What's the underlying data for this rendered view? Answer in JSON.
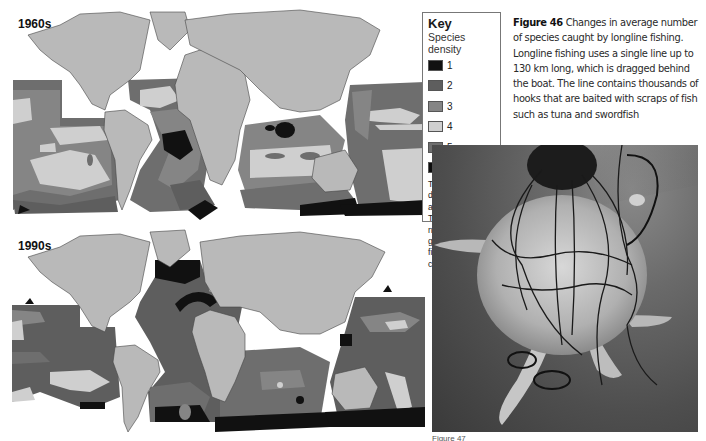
{
  "figure_46": {
    "number_label": "Figure 46",
    "caption": "Changes in average number of species caught by longline fishing. Longline fishing uses a single line up to 130 km long, which is dragged behind the boat. The line contains thousands of hooks that are baited with scraps of fish such as tuna and swordfish"
  },
  "maps": [
    {
      "label": "1960s"
    },
    {
      "label": "1990s"
    }
  ],
  "key": {
    "title": "Key",
    "subtitle": "Species density",
    "items": [
      {
        "value": "1",
        "color": "#111111"
      },
      {
        "value": "2",
        "color": "#5e5e5e"
      },
      {
        "value": "3",
        "color": "#858585"
      },
      {
        "value": "4",
        "color": "#cfcfcf"
      },
      {
        "value": "5",
        "color": "#6e6e6e"
      },
      {
        "value": "6",
        "color": "#0d0d0d"
      }
    ],
    "note": "The species density number is a 6-point scale. The larger the number, the greater variety of fish that are caught."
  },
  "colors": {
    "land": "#b9b9b9",
    "background": "#ffffff"
  },
  "photo": {
    "subject": "sea turtle entangled in longline fishing gear"
  },
  "figure_47": {
    "caption_partial": "Figure 47"
  }
}
